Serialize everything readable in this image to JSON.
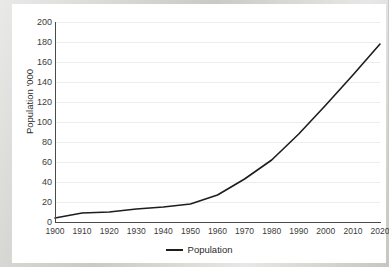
{
  "chart_data": {
    "type": "line",
    "title": "",
    "xlabel": "",
    "ylabel": "Population '000",
    "ylim": [
      0,
      200
    ],
    "xlim": [
      1900,
      2020
    ],
    "grid": true,
    "legend_position": "bottom",
    "y_ticks": [
      200,
      180,
      160,
      140,
      120,
      100,
      80,
      60,
      40,
      20,
      0
    ],
    "x_ticks": [
      1900,
      1910,
      1920,
      1930,
      1940,
      1950,
      1960,
      1970,
      1980,
      1990,
      2000,
      2010,
      2020
    ],
    "x": [
      1900,
      1910,
      1920,
      1930,
      1940,
      1950,
      1960,
      1970,
      1980,
      1990,
      2000,
      2010,
      2020
    ],
    "series": [
      {
        "name": "Population",
        "color": "#1d1d1d",
        "values": [
          4,
          9,
          10,
          13,
          15,
          18,
          27,
          43,
          62,
          88,
          117,
          147,
          178
        ]
      }
    ]
  },
  "legend": {
    "entries": [
      {
        "label": "Population",
        "color": "#1d1d1d"
      }
    ]
  },
  "axes": {
    "y_title": "Population '000",
    "y_tick_labels": [
      "200",
      "180",
      "160",
      "140",
      "120",
      "100",
      "80",
      "60",
      "40",
      "20",
      "0"
    ],
    "x_tick_labels": [
      "1900",
      "1910",
      "1920",
      "1930",
      "1940",
      "1950",
      "1960",
      "1970",
      "1980",
      "1990",
      "2000",
      "2010",
      "2020"
    ]
  },
  "colors": {
    "series_line": "#1d1d1d",
    "gridline": "#ededed",
    "axis": "#4a4a4a",
    "plot_background": "#ffffff",
    "page_background": "#cfcfcb"
  }
}
